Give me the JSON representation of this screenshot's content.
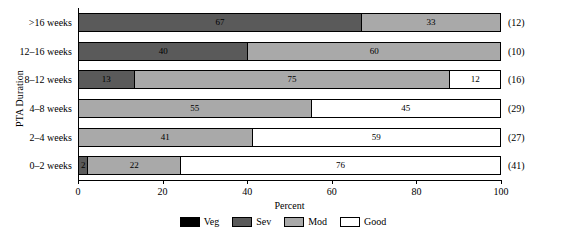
{
  "chart_data": {
    "type": "bar",
    "orientation": "horizontal",
    "stacked": true,
    "title": "",
    "xlabel": "Percent",
    "ylabel": "PTA Duration",
    "xlim": [
      0,
      100
    ],
    "xticks": [
      "0",
      "20",
      "40",
      "60",
      "80",
      "100"
    ],
    "xtick_values": [
      0,
      20,
      40,
      60,
      80,
      100
    ],
    "grid": false,
    "legend_position": "bottom",
    "categories": [
      "0–2 weeks",
      "2–4 weeks",
      "4–8 weeks",
      "8–12 weeks",
      "12–16 weeks",
      ">16 weeks"
    ],
    "categories_top_to_bottom": [
      ">16 weeks",
      "12–16 weeks",
      "8–12 weeks",
      "4–8 weeks",
      "2–4 weeks",
      "0–2 weeks"
    ],
    "series": [
      {
        "name": "Veg",
        "color": "#000000",
        "values": [
          0,
          0,
          0,
          0,
          0,
          0
        ]
      },
      {
        "name": "Sev",
        "color": "#5a5a5a",
        "values": [
          2,
          0,
          0,
          13,
          40,
          67
        ]
      },
      {
        "name": "Mod",
        "color": "#a9a9a9",
        "values": [
          22,
          41,
          55,
          75,
          60,
          33
        ]
      },
      {
        "name": "Good",
        "color": "#ffffff",
        "values": [
          76,
          59,
          45,
          12,
          0,
          0
        ]
      }
    ],
    "group_counts": [
      "(41)",
      "(27)",
      "(29)",
      "(16)",
      "(10)",
      "(12)"
    ],
    "rows_top_to_bottom": [
      {
        "category": ">16 weeks",
        "count": "(12)",
        "segments": [
          {
            "series": "Sev",
            "value": 67,
            "label": "67"
          },
          {
            "series": "Mod",
            "value": 33,
            "label": "33"
          }
        ]
      },
      {
        "category": "12–16 weeks",
        "count": "(10)",
        "segments": [
          {
            "series": "Sev",
            "value": 40,
            "label": "40"
          },
          {
            "series": "Mod",
            "value": 60,
            "label": "60"
          }
        ]
      },
      {
        "category": "8–12 weeks",
        "count": "(16)",
        "segments": [
          {
            "series": "Sev",
            "value": 13,
            "label": "13"
          },
          {
            "series": "Mod",
            "value": 75,
            "label": "75"
          },
          {
            "series": "Good",
            "value": 12,
            "label": "12"
          }
        ]
      },
      {
        "category": "4–8 weeks",
        "count": "(29)",
        "segments": [
          {
            "series": "Mod",
            "value": 55,
            "label": "55"
          },
          {
            "series": "Good",
            "value": 45,
            "label": "45"
          }
        ]
      },
      {
        "category": "2–4 weeks",
        "count": "(27)",
        "segments": [
          {
            "series": "Mod",
            "value": 41,
            "label": "41"
          },
          {
            "series": "Good",
            "value": 59,
            "label": "59"
          }
        ]
      },
      {
        "category": "0–2 weeks",
        "count": "(41)",
        "segments": [
          {
            "series": "Sev",
            "value": 2,
            "label": "2"
          },
          {
            "series": "Mod",
            "value": 22,
            "label": "22"
          },
          {
            "series": "Good",
            "value": 76,
            "label": "76"
          }
        ]
      }
    ],
    "legend": [
      {
        "label": "Veg",
        "color": "#000000"
      },
      {
        "label": "Sev",
        "color": "#5a5a5a"
      },
      {
        "label": "Mod",
        "color": "#a9a9a9"
      },
      {
        "label": "Good",
        "color": "#ffffff"
      }
    ]
  }
}
